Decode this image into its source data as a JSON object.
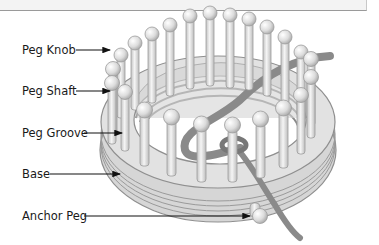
{
  "diagram": {
    "labels": [
      {
        "id": "peg-knob",
        "text": "Peg Knob"
      },
      {
        "id": "peg-shaft",
        "text": "Peg Shaft"
      },
      {
        "id": "peg-groove",
        "text": "Peg Groove"
      },
      {
        "id": "base",
        "text": "Base"
      },
      {
        "id": "anchor-peg",
        "text": "Anchor Peg"
      }
    ],
    "colors": {
      "peg_fill": "#e6e6e6",
      "peg_stroke": "#9c9c9c",
      "base_fill": "#dcdcdc",
      "yarn": "#8a8a8a",
      "arrow": "#111111"
    }
  }
}
